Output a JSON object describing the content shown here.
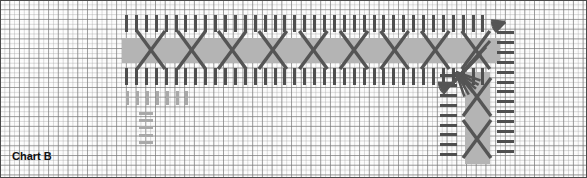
{
  "chart": {
    "title": "Chart B",
    "type": "knitting-stitch-chart",
    "width_px": 587,
    "height_px": 178,
    "background_color": "#fdfdfd",
    "grid": {
      "major_cell_px": 9.73,
      "minor_cell_px": 4.87,
      "major_color": "#787878",
      "minor_color": "#a5a5a5",
      "border_color": "#4a4a4a"
    },
    "palette": {
      "band_gray": "#b4b4b4",
      "stitch_dark": "#4f4f4f",
      "stitch_light": "#a9a9a9",
      "symbol_stroke": "#555555",
      "title_color": "#111111"
    }
  },
  "sections": {
    "horizontal": {
      "name": "horizontal-cable-band",
      "left": 125,
      "top": 14,
      "width": 372,
      "height": 58,
      "band": {
        "left": 122,
        "top": 38,
        "width": 378,
        "height": 25
      },
      "top_row": {
        "count": 37,
        "y": 15,
        "height": 17,
        "spacing": 9.9,
        "width": 3,
        "color": "#4f4f4f"
      },
      "bottom_row": {
        "count": 37,
        "y": 68,
        "height": 17,
        "spacing": 9.9,
        "width": 3,
        "color": "#4f4f4f"
      },
      "cables": {
        "count": 9,
        "first_cx": 151,
        "spacing": 40.6,
        "cy": 50,
        "half_w": 14,
        "half_h": 19
      }
    },
    "lower_left": {
      "name": "lower-left-light-stitches",
      "vertical_dashes": {
        "count": 7,
        "x_start": 126,
        "y": 91,
        "height": 14,
        "spacing": 9.9,
        "width": 3,
        "color": "#a9a9a9"
      },
      "horizontal_dashes": {
        "count": 5,
        "x": 139,
        "y_start": 112,
        "width": 14,
        "height": 3,
        "spacing": 7.2,
        "color": "#a9a9a9"
      }
    },
    "vertical": {
      "name": "vertical-cable-band",
      "band": {
        "left": 465,
        "top": 72,
        "width": 25,
        "height": 92
      },
      "left_col": {
        "count": 9,
        "x": 440,
        "y_start": 74,
        "width": 17,
        "height": 3,
        "spacing": 9.9,
        "color": "#4f4f4f"
      },
      "right_col": {
        "count": 13,
        "x": 497,
        "y_start": 31,
        "width": 17,
        "height": 3,
        "spacing": 9.9,
        "color": "#4f4f4f"
      },
      "cables": {
        "count": 2,
        "cx": 477,
        "cy_start": 97,
        "spacing": 42,
        "half_w": 14,
        "half_h": 19
      }
    },
    "fans": [
      {
        "name": "fan-top-right",
        "x": 505,
        "y": 22,
        "rotation": 160,
        "rays": 6
      },
      {
        "name": "fan-middle",
        "x": 456,
        "y": 72,
        "rotation": 45,
        "rays": 6
      },
      {
        "name": "fan-inner",
        "x": 452,
        "y": 83,
        "rotation": 155,
        "rays": 6
      }
    ]
  },
  "legend": {
    "symbols": [
      {
        "name": "knit-stitch",
        "glyph": "vertical-dash"
      },
      {
        "name": "purl-stitch",
        "glyph": "horizontal-dash"
      },
      {
        "name": "cable-cross",
        "glyph": "x-cross"
      },
      {
        "name": "gathered-decrease",
        "glyph": "fan"
      }
    ]
  }
}
